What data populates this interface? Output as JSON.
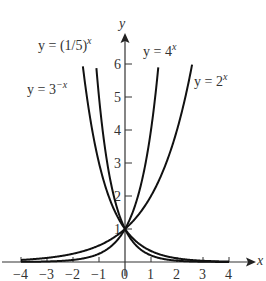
{
  "chart_data": {
    "type": "line",
    "title": "",
    "xlabel": "x",
    "ylabel": "y",
    "xlim": [
      -4,
      4
    ],
    "ylim": [
      0,
      6
    ],
    "xticks": [
      "−4",
      "−3",
      "−2",
      "−1",
      "0",
      "1",
      "2",
      "3",
      "4"
    ],
    "yticks": [
      "1",
      "2",
      "3",
      "4",
      "5",
      "6"
    ],
    "grid": false,
    "series": [
      {
        "name": "y = (1/5)^x",
        "base": 0.2,
        "label_base": "y = (1/5)",
        "label_exp": "x"
      },
      {
        "name": "y = 3^-x",
        "base": 0.3333,
        "label_base": "y = 3",
        "label_exp": "−x"
      },
      {
        "name": "y = 4^x",
        "base": 4,
        "label_base": "y = 4",
        "label_exp": "x"
      },
      {
        "name": "y = 2^x",
        "base": 2,
        "label_base": "y = 2",
        "label_exp": "x"
      }
    ],
    "annotations": [
      "All curves intersect at (0, 1)"
    ]
  },
  "axes": {
    "x_label": "x",
    "y_label": "y"
  }
}
